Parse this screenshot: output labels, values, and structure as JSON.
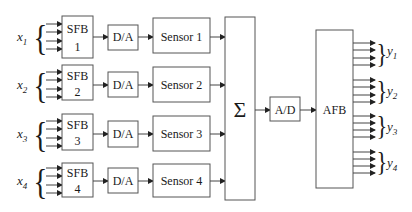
{
  "diagram": {
    "type": "block-diagram",
    "inputs": [
      {
        "var": "x",
        "sub": "1",
        "sfb_title": "SFB",
        "sfb_index": "1",
        "dac": "D/A",
        "sensor": "Sensor 1"
      },
      {
        "var": "x",
        "sub": "2",
        "sfb_title": "SFB",
        "sfb_index": "2",
        "dac": "D/A",
        "sensor": "Sensor 2"
      },
      {
        "var": "x",
        "sub": "3",
        "sfb_title": "SFB",
        "sfb_index": "3",
        "dac": "D/A",
        "sensor": "Sensor 3"
      },
      {
        "var": "x",
        "sub": "4",
        "sfb_title": "SFB",
        "sfb_index": "4",
        "dac": "D/A",
        "sensor": "Sensor 4"
      }
    ],
    "summer": {
      "symbol": "Σ"
    },
    "adc": {
      "label": "A/D"
    },
    "afb": {
      "label": "AFB"
    },
    "outputs": [
      {
        "var": "y",
        "sub": "1"
      },
      {
        "var": "y",
        "sub": "2"
      },
      {
        "var": "y",
        "sub": "3"
      },
      {
        "var": "y",
        "sub": "4"
      }
    ],
    "arrows_per_group": 4,
    "colors": {
      "stroke": "#555555",
      "text": "#1a1a1a",
      "background": "#ffffff"
    }
  }
}
